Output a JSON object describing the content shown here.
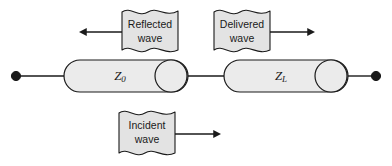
{
  "figure": {
    "background_color": "#ffffff",
    "line_color": "#1a1a1a",
    "fill_color": "#e3e3e3",
    "cylinder_fill": "#ebebeb"
  },
  "labels": {
    "reflected_wave": {
      "line1": "Reflected",
      "line2": "wave",
      "arrow_direction": "left"
    },
    "delivered_wave": {
      "line1": "Delivered",
      "line2": "wave",
      "arrow_direction": "right"
    },
    "incident_wave": {
      "line1": "Incident",
      "line2": "wave",
      "arrow_direction": "right"
    }
  },
  "components": {
    "source_impedance": {
      "symbol": "Z",
      "subscript": "0",
      "name": "characteristic-impedance"
    },
    "load_impedance": {
      "symbol": "Z",
      "subscript": "L",
      "name": "load-impedance"
    }
  },
  "terminals": {
    "left_terminal": "left-node-dot",
    "right_terminal": "right-node-dot"
  }
}
